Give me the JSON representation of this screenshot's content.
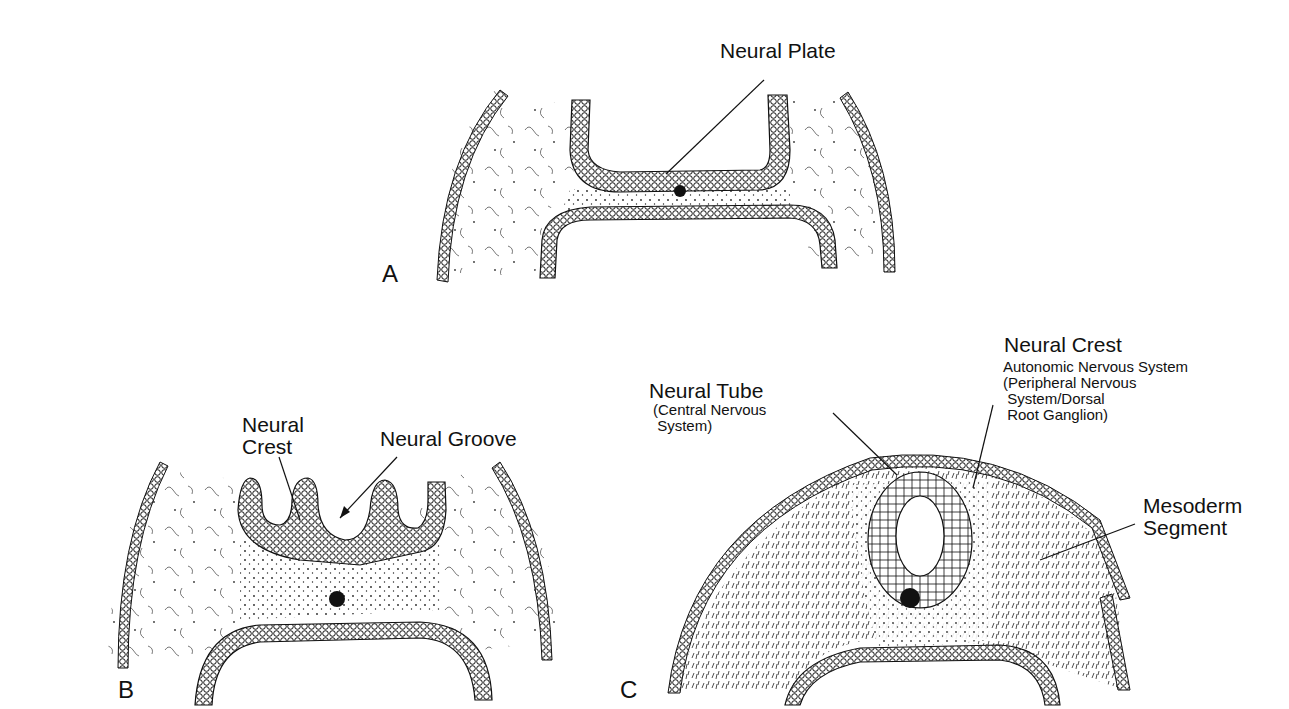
{
  "figure": {
    "panels": [
      {
        "id": "A",
        "label": "A",
        "annotations": [
          {
            "text": "Neural Plate"
          }
        ]
      },
      {
        "id": "B",
        "label": "B",
        "annotations": [
          {
            "text": "Neural\nCrest"
          },
          {
            "text": "Neural Groove"
          }
        ]
      },
      {
        "id": "C",
        "label": "C",
        "annotations": [
          {
            "text": "Neural Tube",
            "sub": "(Central Nervous\n System)"
          },
          {
            "text": "Neural Crest",
            "sub": "Autonomic Nervous System\n(Peripheral Nervous\n System/Dorsal\n Root Ganglion)"
          },
          {
            "text": "Mesoderm\nSegment"
          }
        ]
      }
    ]
  },
  "labels": {
    "a_panel": "A",
    "b_panel": "B",
    "c_panel": "C",
    "neural_plate": "Neural Plate",
    "neural_crest_b_1": "Neural",
    "neural_crest_b_2": "Crest",
    "neural_groove": "Neural Groove",
    "neural_tube": "Neural Tube",
    "neural_tube_sub": "(Central Nervous\n System)",
    "neural_crest_c": "Neural Crest",
    "neural_crest_c_sub": "Autonomic Nervous System\n(Peripheral Nervous\n System/Dorsal\n Root Ganglion)",
    "mesoderm_1": "Mesoderm",
    "mesoderm_2": "Segment"
  },
  "colors": {
    "ink": "#111111",
    "background": "#ffffff"
  }
}
